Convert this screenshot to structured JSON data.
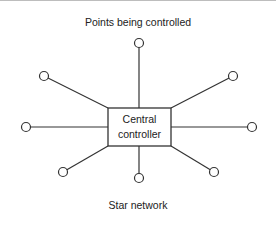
{
  "diagram": {
    "title": "Points being controlled",
    "caption": "Star network",
    "hub": {
      "label_line1": "Central",
      "label_line2": "controller",
      "x": 108,
      "y": 108,
      "width": 63,
      "height": 38
    },
    "nodes": [
      {
        "name": "top",
        "x": 139,
        "y": 43,
        "anchor_x": 139,
        "anchor_y": 108
      },
      {
        "name": "upper-left",
        "x": 44,
        "y": 76,
        "anchor_x": 108,
        "anchor_y": 108
      },
      {
        "name": "upper-right",
        "x": 233,
        "y": 76,
        "anchor_x": 171,
        "anchor_y": 108
      },
      {
        "name": "left",
        "x": 26,
        "y": 127,
        "anchor_x": 108,
        "anchor_y": 127
      },
      {
        "name": "right",
        "x": 252,
        "y": 127,
        "anchor_x": 171,
        "anchor_y": 127
      },
      {
        "name": "lower-left",
        "x": 63,
        "y": 172,
        "anchor_x": 108,
        "anchor_y": 146
      },
      {
        "name": "bottom",
        "x": 139,
        "y": 178,
        "anchor_x": 139,
        "anchor_y": 146
      },
      {
        "name": "lower-right",
        "x": 214,
        "y": 172,
        "anchor_x": 171,
        "anchor_y": 146
      }
    ],
    "node_radius": 4.5,
    "stroke_color": "#333333"
  }
}
